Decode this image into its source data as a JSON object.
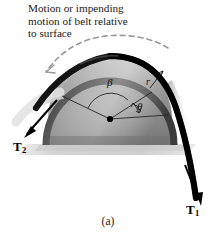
{
  "figure": {
    "number_label": "(a)",
    "caption_lines": [
      "Motion or impending",
      "motion of belt relative",
      "to surface"
    ],
    "labels": {
      "tension_1_symbol": "T",
      "tension_1_subscript": "1",
      "tension_2_symbol": "T",
      "tension_2_subscript": "2",
      "angle_beta": "β",
      "angle_theta": "θ",
      "radius": "r"
    },
    "colors": {
      "background": "#ffffff",
      "belt": "#141414",
      "drum_light": "#d8d8d8",
      "drum_mid": "#9a9a9a",
      "drum_dark": "#6f6f6f",
      "ground_shadow": "#d3d3d3",
      "text": "#1a1a1a",
      "motion_arc": "#8f8f8f",
      "construction_line": "#2a2a2a"
    },
    "geometry": {
      "drum_center_x": 110,
      "drum_center_y": 119,
      "drum_radius": 62,
      "center_dot_radius": 3
    }
  }
}
